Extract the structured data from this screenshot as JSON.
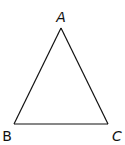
{
  "diagram": {
    "type": "triangle",
    "stroke_color": "#111111",
    "background": "#ffffff",
    "vertices": [
      {
        "id": "A",
        "label": "A",
        "x": 61,
        "y": 28,
        "label_x": 61,
        "label_y": 22
      },
      {
        "id": "B",
        "label": "B",
        "x": 14,
        "y": 124,
        "label_x": 7,
        "label_y": 141
      },
      {
        "id": "C",
        "label": "C",
        "x": 108,
        "y": 124,
        "label_x": 117,
        "label_y": 141
      }
    ],
    "edges": [
      [
        "A",
        "B"
      ],
      [
        "B",
        "C"
      ],
      [
        "C",
        "A"
      ]
    ]
  }
}
